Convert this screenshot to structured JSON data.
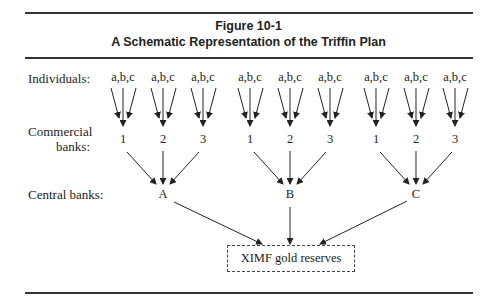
{
  "figure": {
    "number": "Figure 10-1",
    "title": "A Schematic Representation of the Triffin Plan"
  },
  "rows": {
    "individuals": "Individuals:",
    "commercial_line1": "Commercial",
    "commercial_line2": "banks:",
    "central": "Central banks:"
  },
  "individual_groups": [
    "a,b,c",
    "a,b,c",
    "a,b,c",
    "a,b,c",
    "a,b,c",
    "a,b,c",
    "a,b,c",
    "a,b,c",
    "a,b,c"
  ],
  "commercial_banks": [
    "1",
    "2",
    "3",
    "1",
    "2",
    "3",
    "1",
    "2",
    "3"
  ],
  "central_banks": [
    "A",
    "B",
    "C"
  ],
  "reserve_box": "XIMF gold reserves",
  "colors": {
    "line": "#222222",
    "rule": "#333333"
  }
}
